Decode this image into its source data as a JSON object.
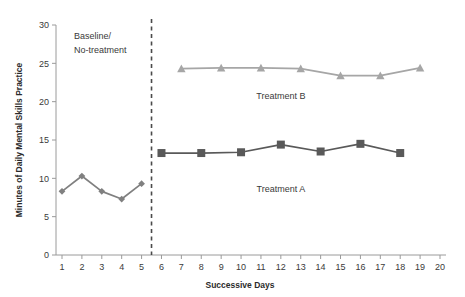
{
  "chart_data": {
    "type": "line",
    "title": "",
    "xlabel": "Successive Days",
    "ylabel": "Minutes of Daily Mental Skills Practice",
    "xlim": [
      0,
      20
    ],
    "ylim": [
      0,
      30
    ],
    "x_ticks": [
      1,
      2,
      3,
      4,
      5,
      6,
      7,
      8,
      9,
      10,
      11,
      12,
      13,
      14,
      15,
      16,
      17,
      18,
      19,
      20
    ],
    "y_ticks": [
      0,
      5,
      10,
      15,
      20,
      25,
      30
    ],
    "grid": false,
    "legend_position": "inline-annotations",
    "annotations": [
      {
        "text": "Baseline/",
        "x": 1.6,
        "y": 28.2
      },
      {
        "text": "No-treatment",
        "x": 1.6,
        "y": 26.4
      },
      {
        "text": "Treatment B",
        "x": 12.0,
        "y": 20.4
      },
      {
        "text": "Treatment A",
        "x": 12.0,
        "y": 8.2
      }
    ],
    "phase_line": {
      "x": 5.5,
      "style": "dashed",
      "color": "#4a4a4a"
    },
    "series": [
      {
        "name": "Baseline",
        "marker": "diamond",
        "color": "#808080",
        "x": [
          1,
          2,
          3,
          4,
          5
        ],
        "values": [
          8.3,
          10.3,
          8.3,
          7.3,
          9.3
        ]
      },
      {
        "name": "Treatment A",
        "marker": "square",
        "color": "#595959",
        "x": [
          6,
          8,
          10,
          12,
          14,
          16,
          18
        ],
        "values": [
          13.3,
          13.3,
          13.4,
          14.4,
          13.5,
          14.5,
          13.3
        ]
      },
      {
        "name": "Treatment B",
        "marker": "triangle",
        "color": "#a6a6a6",
        "x": [
          7,
          9,
          11,
          13,
          15,
          17,
          19
        ],
        "values": [
          24.3,
          24.4,
          24.4,
          24.3,
          23.4,
          23.4,
          24.4
        ]
      }
    ]
  },
  "labels": {
    "x_axis_title": "Successive Days",
    "y_axis_title": "Minutes of Daily Mental Skills Practice",
    "phase_baseline_line1": "Baseline/",
    "phase_baseline_line2": "No-treatment",
    "series_a_label": "Treatment A",
    "series_b_label": "Treatment B"
  },
  "colors": {
    "baseline": "#808080",
    "treatment_a": "#595959",
    "treatment_b": "#a6a6a6",
    "axis": "#9a9a9a",
    "text": "#3a3a3a",
    "divider": "#4a4a4a",
    "background": "#ffffff"
  }
}
